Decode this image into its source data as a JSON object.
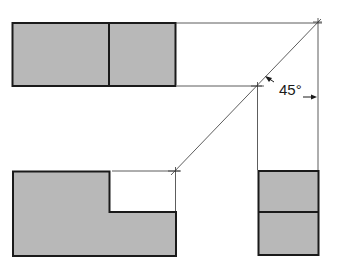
{
  "diagram": {
    "type": "orthographic-projection",
    "annotation": {
      "angle_label": "45°"
    },
    "views": [
      {
        "name": "top-view",
        "shape": "rectangle-divided"
      },
      {
        "name": "front-view",
        "shape": "l-shape"
      },
      {
        "name": "side-view",
        "shape": "rectangle-divided"
      }
    ],
    "colors": {
      "fill": "#b8b8b8",
      "outline": "#1a1a1a",
      "construction": "#333333",
      "background": "#ffffff"
    }
  }
}
